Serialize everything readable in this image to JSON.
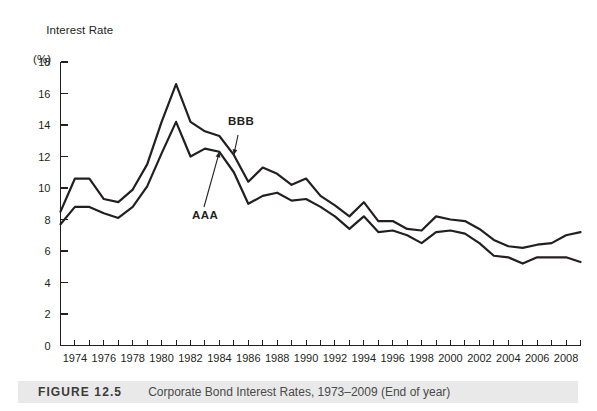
{
  "figure": {
    "label": "FIGURE 12.5",
    "caption": "Corporate Bond Interest Rates, 1973–2009 (End of year)"
  },
  "axis_title": {
    "line1": "Interest Rate",
    "line2": "(%)"
  },
  "annotations": {
    "bbb": "BBB",
    "aaa": "AAA"
  },
  "chart_data": {
    "type": "line",
    "title": "Corporate Bond Interest Rates, 1973–2009 (End of year)",
    "xlabel": "",
    "ylabel": "Interest Rate (%)",
    "xlim": [
      1973,
      2009
    ],
    "ylim": [
      0,
      18
    ],
    "ytick_step": 2,
    "grid": false,
    "legend_position": "inline-annotation",
    "x": [
      1973,
      1974,
      1975,
      1976,
      1977,
      1978,
      1979,
      1980,
      1981,
      1982,
      1983,
      1984,
      1985,
      1986,
      1987,
      1988,
      1989,
      1990,
      1991,
      1992,
      1993,
      1994,
      1995,
      1996,
      1997,
      1998,
      1999,
      2000,
      2001,
      2002,
      2003,
      2004,
      2005,
      2006,
      2007,
      2008,
      2009
    ],
    "xtick_labels": [
      "1974",
      "1976",
      "1978",
      "1980",
      "1982",
      "1984",
      "1986",
      "1988",
      "1990",
      "1992",
      "1994",
      "1996",
      "1998",
      "2000",
      "2002",
      "2004",
      "2006",
      "2008"
    ],
    "ytick_labels": [
      "0",
      "2",
      "4",
      "6",
      "8",
      "10",
      "12",
      "14",
      "16",
      "18"
    ],
    "series": [
      {
        "name": "BBB",
        "values": [
          8.5,
          10.6,
          10.6,
          9.3,
          9.1,
          9.9,
          11.5,
          14.2,
          16.6,
          14.2,
          13.6,
          13.3,
          12.1,
          10.4,
          11.3,
          10.9,
          10.2,
          10.6,
          9.5,
          8.9,
          8.2,
          9.1,
          7.9,
          7.9,
          7.4,
          7.3,
          8.2,
          8.0,
          7.9,
          7.4,
          6.7,
          6.3,
          6.2,
          6.4,
          6.5,
          7.0,
          7.2
        ]
      },
      {
        "name": "AAA",
        "values": [
          7.7,
          8.8,
          8.8,
          8.4,
          8.1,
          8.8,
          10.1,
          12.2,
          14.2,
          12.0,
          12.5,
          12.3,
          11.0,
          9.0,
          9.5,
          9.7,
          9.2,
          9.3,
          8.8,
          8.2,
          7.4,
          8.2,
          7.2,
          7.3,
          7.0,
          6.5,
          7.2,
          7.3,
          7.1,
          6.5,
          5.7,
          5.6,
          5.2,
          5.6,
          5.6,
          5.6,
          5.3
        ]
      }
    ],
    "annotations": [
      {
        "text": "BBB",
        "points_to_series": "BBB",
        "at_x": 1985
      },
      {
        "text": "AAA",
        "points_to_series": "AAA",
        "at_x": 1984
      }
    ]
  }
}
